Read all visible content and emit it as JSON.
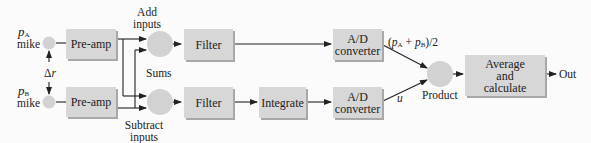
{
  "diagram": {
    "type": "block-diagram",
    "colors": {
      "background": "#fbfbfb",
      "box_fill": "#d7d7d7",
      "box_shadow": "#a8a8a8",
      "circle_fill": "#d2d2d2",
      "line": "#222222"
    },
    "microphones": [
      {
        "id": "mike-a",
        "label_symbol": "p",
        "label_sub": "A",
        "label_text": "mike"
      },
      {
        "id": "mike-b",
        "label_symbol": "p",
        "label_sub": "B",
        "label_text": "mike"
      }
    ],
    "spacing_label": {
      "symbol": "Δ",
      "var": "r"
    },
    "blocks": {
      "preamp_a": "Pre-amp",
      "preamp_b": "Pre-amp",
      "filter_a": "Filter",
      "filter_b": "Filter",
      "integrate": "Integrate",
      "adc_a_line1": "A/D",
      "adc_a_line2": "converter",
      "adc_b_line1": "A/D",
      "adc_b_line2": "converter",
      "average_line1": "Average",
      "average_line2": "and",
      "average_line3": "calculate"
    },
    "labels": {
      "add_inputs_line1": "Add",
      "add_inputs_line2": "inputs",
      "sums": "Sums",
      "subtract_inputs_line1": "Subtract",
      "subtract_inputs_line2": "inputs",
      "product": "Product",
      "out": "Out",
      "pressure_avg_open": "(",
      "pressure_avg_p": "p",
      "pressure_avg_sub_a": "A",
      "pressure_avg_plus": " + ",
      "pressure_avg_sub_b": "B",
      "pressure_avg_close": ")/2",
      "velocity": "u"
    },
    "connections": [
      {
        "from": "mike-a",
        "to": "preamp_a"
      },
      {
        "from": "mike-b",
        "to": "preamp_b"
      },
      {
        "from": "preamp_a",
        "to": "sum_top",
        "note": "add input"
      },
      {
        "from": "preamp_a",
        "to": "sum_bottom",
        "note": "subtract input"
      },
      {
        "from": "preamp_b",
        "to": "sum_top",
        "note": "add input"
      },
      {
        "from": "preamp_b",
        "to": "sum_bottom",
        "note": "subtract input"
      },
      {
        "from": "sum_top",
        "to": "filter_a"
      },
      {
        "from": "sum_bottom",
        "to": "filter_b"
      },
      {
        "from": "filter_a",
        "to": "adc_a"
      },
      {
        "from": "filter_b",
        "to": "integrate"
      },
      {
        "from": "integrate",
        "to": "adc_b"
      },
      {
        "from": "adc_a",
        "to": "product",
        "label": "(pA + pB)/2"
      },
      {
        "from": "adc_b",
        "to": "product",
        "label": "u"
      },
      {
        "from": "product",
        "to": "average"
      },
      {
        "from": "average",
        "to": "out"
      }
    ]
  }
}
